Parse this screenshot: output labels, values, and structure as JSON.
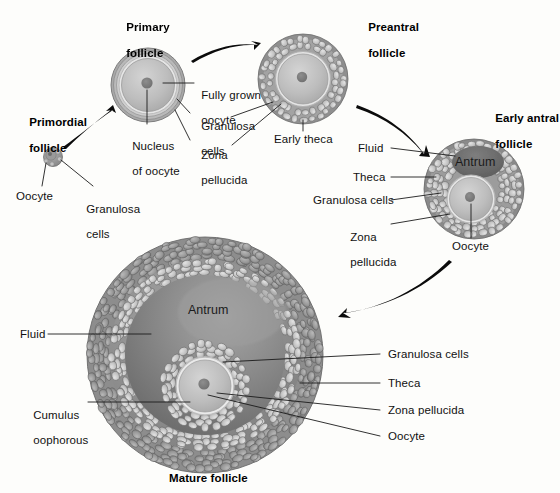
{
  "diagram": {
    "background_color": "#fdfdfb",
    "ink_color": "#111111"
  },
  "stages": [
    {
      "id": "primordial",
      "heading": "Primordial\nfollicle",
      "heading_lines": [
        "Primordial",
        "follicle"
      ],
      "labels": [
        "Oocyte",
        "Granulosa\ncells"
      ]
    },
    {
      "id": "primary",
      "heading": "Primary\nfollicle",
      "heading_lines": [
        "Primary",
        "follicle"
      ],
      "labels": [
        "Nucleus\nof oocyte",
        "Fully grown\noocyte",
        "Granulosa\ncells",
        "Zona\npellucida"
      ]
    },
    {
      "id": "preantral",
      "heading": "Preantral\nfollicle",
      "heading_lines": [
        "Preantral",
        "follicle"
      ],
      "labels": [
        "Early theca"
      ]
    },
    {
      "id": "early-antral",
      "heading": "Early antral\nfollicle",
      "heading_lines": [
        "Early antral",
        "follicle"
      ],
      "labels": [
        "Fluid",
        "Antrum",
        "Theca",
        "Granulosa cells",
        "Zona\npellucida",
        "Oocyte"
      ]
    },
    {
      "id": "mature",
      "heading": "Mature follicle",
      "heading_lines": [
        "Mature follicle"
      ],
      "labels": [
        "Fluid",
        "Antrum",
        "Cumulus\noophorous",
        "Granulosa cells",
        "Theca",
        "Zona pellucida",
        "Oocyte"
      ]
    }
  ],
  "headings": {
    "primordial_l1": "Primordial",
    "primordial_l2": "follicle",
    "primary_l1": "Primary",
    "primary_l2": "follicle",
    "preantral_l1": "Preantral",
    "preantral_l2": "follicle",
    "early_antral_l1": "Early antral",
    "early_antral_l2": "follicle",
    "mature": "Mature follicle"
  },
  "labels": {
    "primordial_oocyte": "Oocyte",
    "primordial_granulosa_l1": "Granulosa",
    "primordial_granulosa_l2": "cells",
    "primary_nucleus_l1": "Nucleus",
    "primary_nucleus_l2": "of oocyte",
    "primary_fully_grown_l1": "Fully grown",
    "primary_fully_grown_l2": "oocyte",
    "primary_granulosa_l1": "Granulosa",
    "primary_granulosa_l2": "cells",
    "primary_zona_l1": "Zona",
    "primary_zona_l2": "pellucida",
    "preantral_early_theca": "Early theca",
    "antral_fluid": "Fluid",
    "antral_antrum": "Antrum",
    "antral_theca": "Theca",
    "antral_granulosa": "Granulosa cells",
    "antral_zona_l1": "Zona",
    "antral_zona_l2": "pellucida",
    "antral_oocyte": "Oocyte",
    "mature_fluid": "Fluid",
    "mature_antrum": "Antrum",
    "mature_cumulus_l1": "Cumulus",
    "mature_cumulus_l2": "oophorous",
    "mature_granulosa": "Granulosa cells",
    "mature_theca": "Theca",
    "mature_zona": "Zona pellucida",
    "mature_oocyte": "Oocyte"
  }
}
